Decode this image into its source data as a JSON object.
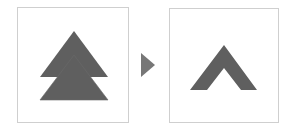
{
  "diagram": {
    "colors": {
      "shape_fill": "#5f5f5f",
      "panel_border": "#cfcfcf",
      "arrow_fill": "#777777",
      "background": "#ffffff"
    },
    "left_panel": {
      "shape": "double-triangle",
      "triangles": [
        {
          "points": "74,31 108,77 40,77"
        },
        {
          "points": "74,55 108,100 40,100"
        }
      ]
    },
    "arrow": {
      "points": "141,53 155,65 141,77"
    },
    "right_panel": {
      "shape": "chevron-up",
      "points": "224,45 257,90 241,90 224,68 207,90 190,90"
    }
  }
}
